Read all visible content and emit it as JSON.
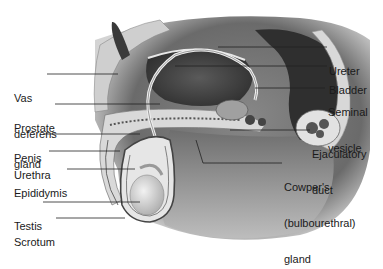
{
  "diagram": {
    "labels_left": [
      {
        "id": "vas-deferens",
        "lines": [
          "Vas",
          "deferens"
        ]
      },
      {
        "id": "prostate-gland",
        "lines": [
          "Prostate",
          "gland"
        ]
      },
      {
        "id": "penis",
        "lines": [
          "Penis"
        ]
      },
      {
        "id": "urethra",
        "lines": [
          "Urethra"
        ]
      },
      {
        "id": "epididymis",
        "lines": [
          "Epididymis"
        ]
      },
      {
        "id": "testis",
        "lines": [
          "Testis"
        ]
      },
      {
        "id": "scrotum",
        "lines": [
          "Scrotum"
        ]
      }
    ],
    "labels_right": [
      {
        "id": "ureter",
        "lines": [
          "Ureter"
        ]
      },
      {
        "id": "bladder",
        "lines": [
          "Bladder"
        ]
      },
      {
        "id": "seminal-vesicle",
        "lines": [
          "Seminal",
          "vesicle"
        ]
      },
      {
        "id": "ejaculatory-duct",
        "lines": [
          "Ejaculatory",
          "duct"
        ]
      },
      {
        "id": "cowpers-gland",
        "lines": [
          "Cowper's",
          "(bulbourethral)",
          "gland"
        ]
      }
    ],
    "colors": {
      "background": "#ffffff",
      "label_text": "#1a1a1a",
      "leader_line": "#222222",
      "tissue_dark": "#3a3a3a",
      "tissue_mid": "#8a8a8a",
      "tissue_light": "#d6d6d6"
    }
  }
}
